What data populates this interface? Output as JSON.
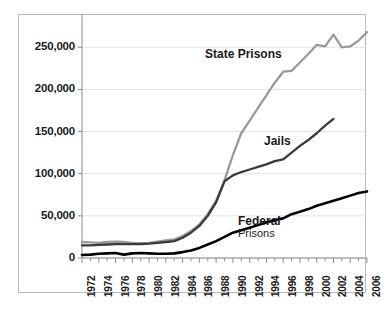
{
  "chart_data": {
    "type": "line",
    "title": "",
    "subtitle": "",
    "xlabel": "",
    "ylabel": "",
    "xlim": [
      1972,
      2006
    ],
    "ylim": [
      0,
      280000
    ],
    "grid": true,
    "legend_position": "inline-annotations",
    "y_ticks": [
      0,
      50000,
      100000,
      150000,
      200000,
      250000
    ],
    "y_tick_labels": [
      "0",
      "50,000",
      "100,000",
      "150,000",
      "200,000",
      "250,000"
    ],
    "x_ticks": [
      1972,
      1974,
      1976,
      1978,
      1980,
      1982,
      1984,
      1986,
      1988,
      1990,
      1992,
      1994,
      1996,
      1998,
      2000,
      2002,
      2004,
      2006
    ],
    "x_tick_labels": [
      "1972",
      "1974",
      "1976",
      "1978",
      "1980",
      "1982",
      "1984",
      "1986",
      "1988",
      "1990",
      "1992",
      "1994",
      "1996",
      "1998",
      "2000",
      "2002",
      "2004",
      "2006"
    ],
    "x_minor_ticks": [
      1973,
      1975,
      1977,
      1979,
      1981,
      1983,
      1985,
      1987,
      1989,
      1991,
      1993,
      1995,
      1997,
      1999,
      2001,
      2003,
      2005
    ],
    "series": [
      {
        "name": "State Prisons",
        "color": "#9a9a9a",
        "x": [
          1972,
          1973,
          1974,
          1975,
          1976,
          1977,
          1978,
          1979,
          1980,
          1981,
          1982,
          1983,
          1984,
          1985,
          1986,
          1987,
          1988,
          1989,
          1990,
          1991,
          1992,
          1993,
          1994,
          1995,
          1996,
          1997,
          1998,
          1999,
          2000,
          2001,
          2002,
          2003,
          2004,
          2005,
          2006
        ],
        "values": [
          19000,
          18500,
          18000,
          19000,
          19500,
          19000,
          18000,
          17500,
          18000,
          19500,
          21000,
          22000,
          26000,
          32000,
          40000,
          52000,
          68000,
          92000,
          122000,
          148000,
          163000,
          178000,
          193000,
          208000,
          221000,
          222000,
          232000,
          242000,
          253000,
          251000,
          265000,
          250000,
          251000,
          258000,
          268000
        ]
      },
      {
        "name": "Jails",
        "color": "#3a3a3a",
        "x": [
          1972,
          1973,
          1974,
          1975,
          1976,
          1977,
          1978,
          1979,
          1980,
          1981,
          1982,
          1983,
          1984,
          1985,
          1986,
          1987,
          1988,
          1989,
          1990,
          1991,
          1992,
          1993,
          1994,
          1995,
          1996,
          1997,
          1998,
          1999,
          2000,
          2001,
          2002
        ],
        "values": [
          15000,
          15000,
          15500,
          16000,
          16500,
          16500,
          16500,
          16500,
          17000,
          18000,
          19000,
          20000,
          24000,
          30000,
          38000,
          50000,
          66000,
          91000,
          98000,
          102000,
          105000,
          108000,
          111000,
          115000,
          117000,
          125000,
          133000,
          140000,
          148000,
          157000,
          165000
        ]
      },
      {
        "name": "Federal Prisons",
        "color": "#000000",
        "x": [
          1972,
          1973,
          1974,
          1975,
          1976,
          1977,
          1978,
          1979,
          1980,
          1981,
          1982,
          1983,
          1984,
          1985,
          1986,
          1987,
          1988,
          1989,
          1990,
          1991,
          1992,
          1993,
          1994,
          1995,
          1996,
          1997,
          1998,
          1999,
          2000,
          2001,
          2002,
          2003,
          2004,
          2005,
          2006
        ],
        "values": [
          3500,
          4000,
          5000,
          5500,
          6000,
          4000,
          5500,
          6000,
          5500,
          5000,
          5000,
          5500,
          7000,
          9000,
          12000,
          16000,
          20000,
          25000,
          30000,
          33000,
          36000,
          39000,
          42000,
          45000,
          47000,
          52000,
          55000,
          58000,
          62000,
          65000,
          68000,
          71000,
          74000,
          77000,
          79000
        ]
      }
    ],
    "annotations": [
      {
        "name": "state-prisons-label",
        "text": "State Prisons",
        "style": "bold"
      },
      {
        "name": "jails-label",
        "text": "Jails",
        "style": "bold"
      },
      {
        "name": "federal-prisons-label-line1",
        "text": "Federal",
        "style": "bold"
      },
      {
        "name": "federal-prisons-label-line2",
        "text": "Prisons",
        "style": "regular"
      }
    ],
    "colors": {
      "state_prisons": "#9a9a9a",
      "jails": "#3a3a3a",
      "federal_prisons": "#000000",
      "gridline": "#e2e2e2",
      "axis": "#8c8c8c",
      "frame": "#b9b9b9",
      "text": "#1a1a1a",
      "background": "#ffffff"
    }
  }
}
